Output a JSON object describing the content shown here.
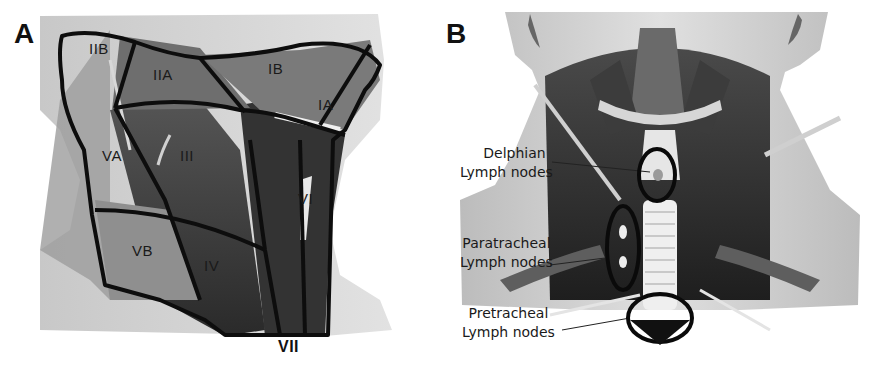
{
  "figure": {
    "panel_a": {
      "letter": "A",
      "regions": {
        "IIB": "IIB",
        "IIA": "IIA",
        "IB": "IB",
        "IA": "IA",
        "VA": "VA",
        "III": "III",
        "VI": "VI",
        "VB": "VB",
        "IV": "IV",
        "VII": "VII"
      }
    },
    "panel_b": {
      "letter": "B",
      "callouts": [
        {
          "line1": "Delphian",
          "line2": "Lymph nodes"
        },
        {
          "line1": "Paratracheal",
          "line2": "Lymph nodes"
        },
        {
          "line1": "Pretracheal",
          "line2": "Lymph nodes"
        }
      ]
    },
    "colors": {
      "skin": "#d9d9d9",
      "muscle_dark": "#2e2e2e",
      "muscle_mid": "#5a5a5a",
      "muscle_light": "#8a8a8a",
      "outline": "#0d0d0d",
      "cartilage": "#efefef"
    }
  }
}
